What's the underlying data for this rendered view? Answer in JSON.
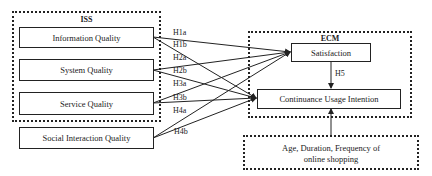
{
  "groups": {
    "iss": {
      "title": "ISS"
    },
    "ecm": {
      "title": "ECM"
    }
  },
  "constructs": {
    "information_quality": "Information Quality",
    "system_quality": "System Quality",
    "service_quality": "Service Quality",
    "social_interaction_quality": "Social Interaction Quality",
    "satisfaction": "Satisfaction",
    "continuance_usage_intention": "Continuance Usage Intention"
  },
  "controls": {
    "line1": "Age, Duration, Frequency of",
    "line2": "online shopping"
  },
  "hypotheses": {
    "h1a": "H1a",
    "h1b": "H1b",
    "h2a": "H2a",
    "h2b": "H2b",
    "h3a": "H3a",
    "h3b": "H3b",
    "h4a": "H4a",
    "h4b": "H4b",
    "h5": "H5"
  },
  "edges": [
    {
      "from": "Information Quality",
      "to": "Satisfaction",
      "label": "H1a"
    },
    {
      "from": "Information Quality",
      "to": "Continuance Usage Intention",
      "label": "H1b"
    },
    {
      "from": "System Quality",
      "to": "Satisfaction",
      "label": "H2a"
    },
    {
      "from": "System Quality",
      "to": "Continuance Usage Intention",
      "label": "H2b"
    },
    {
      "from": "Service Quality",
      "to": "Satisfaction",
      "label": "H3a"
    },
    {
      "from": "Service Quality",
      "to": "Continuance Usage Intention",
      "label": "H3b"
    },
    {
      "from": "Social Interaction Quality",
      "to": "Satisfaction",
      "label": "H4a"
    },
    {
      "from": "Social Interaction Quality",
      "to": "Continuance Usage Intention",
      "label": "H4b"
    },
    {
      "from": "Satisfaction",
      "to": "Continuance Usage Intention",
      "label": "H5"
    },
    {
      "from": "Age, Duration, Frequency of online shopping",
      "to": "Continuance Usage Intention",
      "label": ""
    }
  ],
  "colors": {
    "stroke": "#222222",
    "background": "#ffffff"
  }
}
